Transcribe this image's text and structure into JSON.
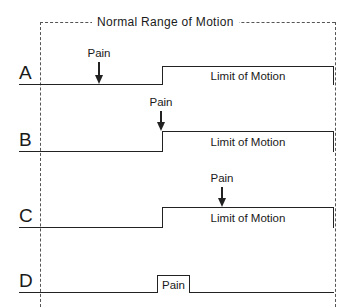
{
  "frame": {
    "title": "Normal Range of Motion",
    "left_x": 40,
    "right_x": 335,
    "top_y": 22,
    "bottom_y": 307
  },
  "rows": [
    {
      "label": "A",
      "baseline_y": 84,
      "limit": {
        "label": "Limit of Motion",
        "x1": 162,
        "x2": 334,
        "top_y": 66
      },
      "pain": {
        "label": "Pain",
        "type": "arrow",
        "x": 99,
        "text_y": 47,
        "arrow_top": 62,
        "arrow_tip": 84
      }
    },
    {
      "label": "B",
      "baseline_y": 151,
      "limit": {
        "label": "Limit of Motion",
        "x1": 162,
        "x2": 334,
        "top_y": 131
      },
      "pain": {
        "label": "Pain",
        "type": "arrow",
        "x": 161,
        "text_y": 96,
        "arrow_top": 111,
        "arrow_tip": 131
      }
    },
    {
      "label": "C",
      "baseline_y": 227,
      "limit": {
        "label": "Limit of Motion",
        "x1": 162,
        "x2": 334,
        "top_y": 207
      },
      "pain": {
        "label": "Pain",
        "type": "arrow",
        "x": 222,
        "text_y": 172,
        "arrow_top": 187,
        "arrow_tip": 207
      }
    },
    {
      "label": "D",
      "baseline_y": 292,
      "limit": null,
      "pain": {
        "label": "Pain",
        "type": "box",
        "x1": 157,
        "x2": 190,
        "top_y": 275
      }
    }
  ],
  "baseline": {
    "x1": 19,
    "x2": 334
  },
  "colors": {
    "ink": "#222222",
    "frame": "#555555",
    "background": "#ffffff"
  }
}
